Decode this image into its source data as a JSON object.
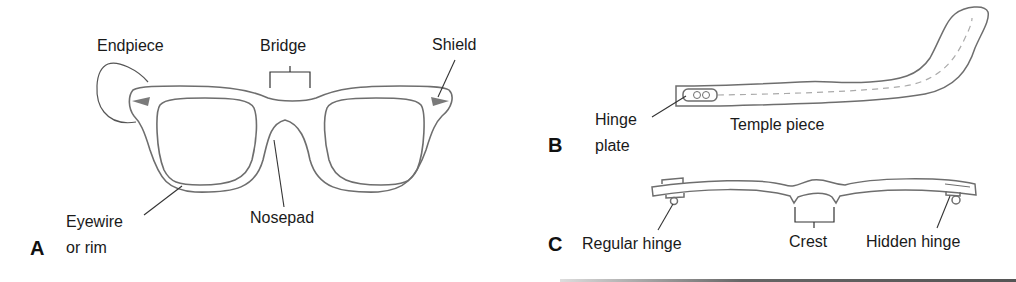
{
  "diagram": {
    "panels": [
      {
        "id": "A",
        "letter": "A",
        "subject": "eyeglass frame front",
        "labels": {
          "endpiece": "Endpiece",
          "bridge": "Bridge",
          "shield": "Shield",
          "eyewire_line1": "Eyewire",
          "eyewire_line2": "or rim",
          "nosepad": "Nosepad"
        }
      },
      {
        "id": "B",
        "letter": "B",
        "subject": "temple piece side view",
        "labels": {
          "hinge_plate_line1": "Hinge",
          "hinge_plate_line2": "plate",
          "temple_piece": "Temple piece"
        }
      },
      {
        "id": "C",
        "letter": "C",
        "subject": "frame top view",
        "labels": {
          "regular_hinge": "Regular hinge",
          "crest": "Crest",
          "hidden_hinge": "Hidden hinge"
        }
      }
    ],
    "colors": {
      "outline": "#6e6e6e",
      "leader": "#333333",
      "shield_fill": "#7a7a7a",
      "dash": "#aaaaaa",
      "text": "#1a1a1a"
    }
  }
}
